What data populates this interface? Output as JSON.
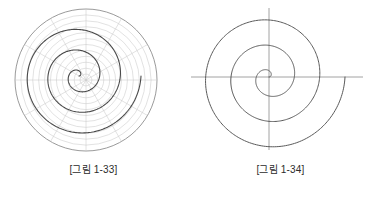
{
  "page": {
    "background_color": "#ffffff",
    "width": 374,
    "height": 197
  },
  "figures": [
    {
      "id": "figure-1-33",
      "caption": "[그림 1-33]",
      "description": "Archimedean spiral drawn on a polar coordinate grid",
      "grid": {
        "visible": true,
        "circle_count": 12,
        "radial_line_count": 12,
        "radial_step_degrees": 30,
        "color": "#c9c9c9",
        "outer_circle_color": "#8f8f8f",
        "center_x": 86,
        "center_y": 80,
        "outer_radius": 71
      },
      "spiral": {
        "type": "archimedean",
        "color": "#4a4a4a",
        "line_width": 1.1,
        "turns": 3,
        "center_x": 79,
        "center_y": 76,
        "max_radius": 62,
        "start_angle_degrees": 0
      }
    },
    {
      "id": "figure-1-34",
      "caption": "[그림 1-34]",
      "description": "Archimedean spiral with horizontal and vertical axes",
      "grid": {
        "visible": false,
        "circle_count": 0,
        "radial_line_count": 0,
        "color": "#9a9a9a"
      },
      "axes": {
        "visible": true,
        "color": "#8a8a8a",
        "line_width": 0.8,
        "center_x": 82,
        "center_y": 77,
        "x_start": 4,
        "x_end": 176,
        "y_start": 8,
        "y_end": 150
      },
      "spiral": {
        "type": "archimedean",
        "color": "#5a5a5a",
        "line_width": 1.0,
        "turns": 3,
        "center_x": 82,
        "center_y": 77,
        "max_radius": 76,
        "start_angle_degrees": 0
      }
    }
  ],
  "chart_data": {
    "type": "line",
    "title": "",
    "xlabel": "",
    "ylabel": "",
    "series": [
      {
        "name": "[그림 1-33] Archimedean spiral r = aθ",
        "coordinate_system": "polar",
        "turns": 3,
        "theta_range_degrees": [
          0,
          1080
        ],
        "r_at_theta": [
          {
            "theta_deg": 0,
            "r": 0
          },
          {
            "theta_deg": 90,
            "r": 5
          },
          {
            "theta_deg": 180,
            "r": 10
          },
          {
            "theta_deg": 270,
            "r": 16
          },
          {
            "theta_deg": 360,
            "r": 21
          },
          {
            "theta_deg": 450,
            "r": 26
          },
          {
            "theta_deg": 540,
            "r": 31
          },
          {
            "theta_deg": 630,
            "r": 36
          },
          {
            "theta_deg": 720,
            "r": 41
          },
          {
            "theta_deg": 810,
            "r": 47
          },
          {
            "theta_deg": 900,
            "r": 52
          },
          {
            "theta_deg": 990,
            "r": 57
          },
          {
            "theta_deg": 1080,
            "r": 62
          }
        ]
      },
      {
        "name": "[그림 1-34] Archimedean spiral r = aθ",
        "coordinate_system": "polar",
        "turns": 3,
        "theta_range_degrees": [
          0,
          1080
        ],
        "r_at_theta": [
          {
            "theta_deg": 0,
            "r": 0
          },
          {
            "theta_deg": 90,
            "r": 6
          },
          {
            "theta_deg": 180,
            "r": 13
          },
          {
            "theta_deg": 270,
            "r": 19
          },
          {
            "theta_deg": 360,
            "r": 25
          },
          {
            "theta_deg": 450,
            "r": 32
          },
          {
            "theta_deg": 540,
            "r": 38
          },
          {
            "theta_deg": 630,
            "r": 44
          },
          {
            "theta_deg": 720,
            "r": 51
          },
          {
            "theta_deg": 810,
            "r": 57
          },
          {
            "theta_deg": 900,
            "r": 63
          },
          {
            "theta_deg": 990,
            "r": 70
          },
          {
            "theta_deg": 1080,
            "r": 76
          }
        ]
      }
    ],
    "grid": true,
    "legend": "none"
  }
}
